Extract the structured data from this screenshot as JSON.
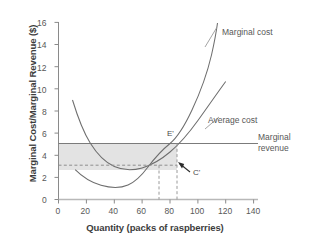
{
  "chart_data": {
    "type": "line",
    "title": "",
    "xlabel": "Quantity (packs of raspberries)",
    "ylabel": "Marginal Cost/Marginal Revenue ($)",
    "xlim": [
      0,
      140
    ],
    "ylim": [
      0,
      16
    ],
    "xticks": [
      "0",
      "20",
      "40",
      "60",
      "80",
      "100",
      "120",
      "140"
    ],
    "yticks": [
      "0",
      "2",
      "4",
      "6",
      "8",
      "10",
      "12",
      "14",
      "16"
    ],
    "grid": false,
    "legend_position": "inline-annotations",
    "series": [
      {
        "name": "Average cost",
        "label": "Average cost",
        "x": [
          10,
          15,
          20,
          25,
          30,
          35,
          40,
          45,
          50,
          55,
          60,
          65,
          70,
          75,
          80,
          85,
          90,
          95,
          100,
          105,
          110,
          115,
          120
        ],
        "y": [
          9.0,
          7.0,
          5.6,
          4.7,
          4.0,
          3.55,
          3.25,
          3.05,
          2.93,
          2.9,
          2.95,
          3.05,
          3.2,
          3.42,
          3.7,
          4.02,
          4.38,
          4.78,
          5.2,
          5.65,
          6.1,
          6.55,
          7.0
        ]
      },
      {
        "name": "Marginal cost",
        "label": "Marginal cost",
        "x": [
          12,
          20,
          25,
          30,
          35,
          40,
          45,
          50,
          55,
          60,
          65,
          70,
          75,
          80,
          85,
          90,
          95,
          100,
          105,
          110
        ],
        "y": [
          2.7,
          2.1,
          1.8,
          1.55,
          1.38,
          1.3,
          1.3,
          1.45,
          1.75,
          2.2,
          2.75,
          3.1,
          3.9,
          4.6,
          5.0,
          6.6,
          7.9,
          9.4,
          11.2,
          15.0
        ]
      },
      {
        "name": "Marginal revenue",
        "label": "Marginal revenue",
        "type": "horizontal-line",
        "y_value": 5.0,
        "x_from": 0,
        "x_to": 143
      }
    ],
    "annotations": [
      {
        "name": "equilibrium-point",
        "label": "E'",
        "x": 85,
        "y": 5.0
      },
      {
        "name": "cost-point",
        "label": "C'",
        "x": 94,
        "y": 2.3,
        "points_to_x": 85,
        "points_to_y": 3.1
      }
    ],
    "shaded_region": {
      "name": "profit-rectangle",
      "x_from": 0,
      "x_to": 85,
      "y_from": 3.1,
      "y_to": 5.0,
      "color": "#e3e3e3"
    },
    "dashed_guides": [
      {
        "name": "average-cost-level",
        "orientation": "horizontal",
        "value": 3.1,
        "from": 0,
        "to": 85
      },
      {
        "name": "quantity-intersection",
        "orientation": "vertical",
        "value": 72,
        "from": 0,
        "to": 3.1
      },
      {
        "name": "quantity-equilibrium",
        "orientation": "vertical",
        "value": 85,
        "from": 0,
        "to": 5.0
      }
    ],
    "colors": {
      "axis": "#8a8a8a",
      "curve": "#6e6e6e",
      "shade": "#e3e3e3",
      "text": "#4a4a4a",
      "dashed": "#9a9a9a"
    }
  }
}
